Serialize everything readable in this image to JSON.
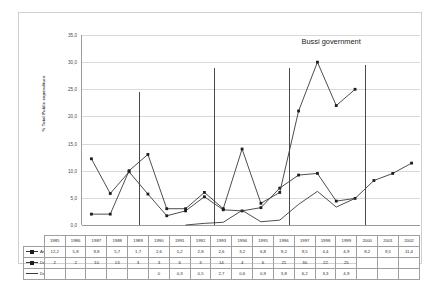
{
  "chart_data": {
    "type": "line",
    "title": "",
    "annotation": "Bussi government",
    "xlabel": "",
    "ylabel": "% Total Public expenditure",
    "ylim": [
      0,
      35
    ],
    "ytick_labels": [
      "35,0",
      "30,0",
      "25,0",
      "20,0",
      "15,0",
      "10,0",
      "5,0",
      "0,0"
    ],
    "ytick_values": [
      35,
      30,
      25,
      20,
      15,
      10,
      5,
      0
    ],
    "grid": true,
    "legend_position": "table",
    "categories": [
      "1985",
      "1986",
      "1987",
      "1988",
      "1989",
      "1990",
      "1991",
      "1992",
      "1993",
      "1994",
      "1995",
      "1996",
      "1997",
      "1998",
      "1999",
      "2000",
      "2001",
      "2002"
    ],
    "series": [
      {
        "name": "Amount of Bocades",
        "marker": "square",
        "labels": [
          "12,2",
          "5,8",
          "9,8",
          "5,7",
          "1,7",
          "2,6",
          "5,2",
          "2,8",
          "2,6",
          "3,2",
          "6,8",
          "9,2",
          "9,5",
          "4,4",
          "4,9",
          "8,2",
          "9,5",
          "11,4"
        ],
        "values": [
          12.2,
          5.8,
          9.8,
          5.7,
          1.7,
          2.6,
          5.2,
          2.8,
          2.6,
          3.2,
          6.8,
          9.2,
          9.5,
          4.4,
          4.9,
          8.2,
          9.5,
          11.4
        ]
      },
      {
        "name": "Debt burden",
        "marker": "square",
        "labels": [
          "2",
          "2",
          "10",
          "13",
          "3",
          "3",
          "6",
          "3",
          "14",
          "4",
          "6",
          "21",
          "30",
          "22",
          "25",
          "",
          "",
          ""
        ],
        "values": [
          2,
          2,
          10,
          13,
          3,
          3,
          6,
          3,
          14,
          4,
          6,
          21,
          30,
          22,
          25,
          null,
          null,
          null
        ]
      },
      {
        "name": "Debt redeeming",
        "marker": "none",
        "labels": [
          "",
          "",
          "",
          "",
          "",
          "0",
          "0,3",
          "0,5",
          "2,7",
          "0,6",
          "0,9",
          "3,8",
          "6,2",
          "3,3",
          "4,9",
          "",
          "",
          ""
        ],
        "values": [
          null,
          null,
          null,
          null,
          null,
          0,
          0.3,
          0.5,
          2.7,
          0.6,
          0.9,
          3.8,
          6.2,
          3.3,
          4.9,
          null,
          null,
          null
        ]
      }
    ],
    "dividers": [
      {
        "after_category": "1987",
        "top_value": 24.5
      },
      {
        "after_category": "1991",
        "top_value": 29.0
      },
      {
        "after_category": "1995",
        "top_value": 29.0
      },
      {
        "after_category": "1999",
        "top_value": 29.5
      }
    ]
  }
}
